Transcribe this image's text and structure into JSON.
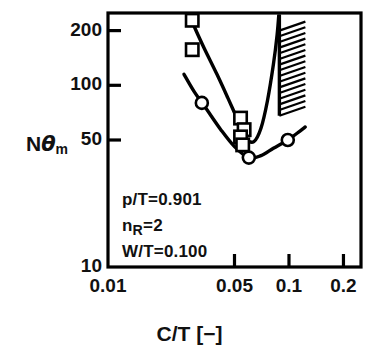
{
  "chart_data": {
    "type": "line",
    "title": "",
    "xlabel": "C/T  [−]",
    "ylabel": "Nθm",
    "xscale": "log",
    "yscale": "log",
    "xlim": [
      0.01,
      0.25
    ],
    "ylim": [
      10,
      250
    ],
    "xticks": [
      0.01,
      0.05,
      0.1,
      0.2
    ],
    "xticklabels": [
      "0.01",
      "0.05",
      "0.1",
      "0.2"
    ],
    "yticks": [
      10,
      50,
      100,
      200
    ],
    "yticklabels": [
      "10",
      "50",
      "100",
      "200"
    ],
    "grid": false,
    "legend": "none",
    "series": [
      {
        "name": "square-series",
        "marker": "square",
        "points": [
          {
            "x": 0.0292,
            "y": 228
          },
          {
            "x": 0.0292,
            "y": 157
          },
          {
            "x": 0.054,
            "y": 66
          },
          {
            "x": 0.0565,
            "y": 57
          },
          {
            "x": 0.054,
            "y": 52
          },
          {
            "x": 0.0555,
            "y": 47
          }
        ],
        "curve": [
          {
            "x": 0.0272,
            "y": 268
          },
          {
            "x": 0.03,
            "y": 210
          },
          {
            "x": 0.034,
            "y": 160
          },
          {
            "x": 0.04,
            "y": 115
          },
          {
            "x": 0.046,
            "y": 85
          },
          {
            "x": 0.053,
            "y": 62
          },
          {
            "x": 0.058,
            "y": 51
          },
          {
            "x": 0.064,
            "y": 49
          },
          {
            "x": 0.07,
            "y": 58
          },
          {
            "x": 0.076,
            "y": 82
          },
          {
            "x": 0.082,
            "y": 130
          },
          {
            "x": 0.086,
            "y": 190
          },
          {
            "x": 0.0885,
            "y": 268
          }
        ]
      },
      {
        "name": "circle-series",
        "marker": "circle",
        "points": [
          {
            "x": 0.033,
            "y": 80
          },
          {
            "x": 0.06,
            "y": 40
          },
          {
            "x": 0.0985,
            "y": 50
          }
        ],
        "curve": [
          {
            "x": 0.0263,
            "y": 115
          },
          {
            "x": 0.03,
            "y": 92
          },
          {
            "x": 0.035,
            "y": 74
          },
          {
            "x": 0.042,
            "y": 57
          },
          {
            "x": 0.05,
            "y": 46
          },
          {
            "x": 0.06,
            "y": 40
          },
          {
            "x": 0.07,
            "y": 41
          },
          {
            "x": 0.082,
            "y": 45
          },
          {
            "x": 0.0985,
            "y": 50
          },
          {
            "x": 0.115,
            "y": 56
          },
          {
            "x": 0.123,
            "y": 59
          }
        ]
      }
    ],
    "boundary": {
      "name": "choke-limit-line",
      "x": 0.0885,
      "y_top": 250,
      "y_bottom": 68,
      "hatch_side": "right",
      "hatch_count": 15
    },
    "annotations": [
      {
        "text": "p/T=0.901",
        "html": "p/T=0.901"
      },
      {
        "text": "nR=2",
        "html": "n<sub>R</sub>=2"
      },
      {
        "text": "W/T=0.100",
        "html": "W/T=0.100"
      }
    ]
  },
  "colors": {
    "axis": "#000000",
    "curve": "#000000",
    "marker_fill": "#ffffff",
    "background": "#ffffff"
  }
}
